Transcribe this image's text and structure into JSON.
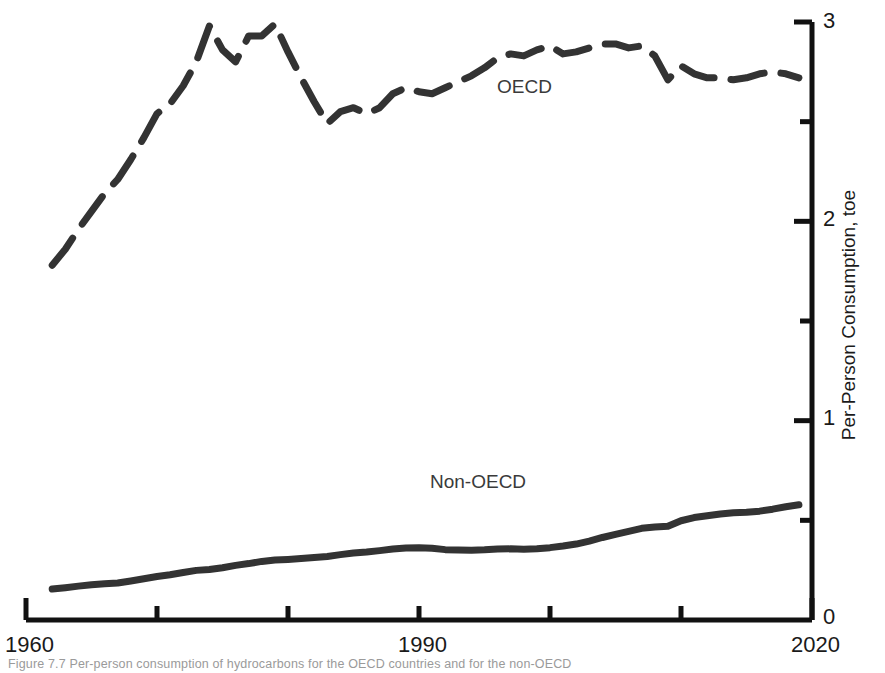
{
  "chart_data": {
    "type": "line",
    "title": "",
    "xlabel": "",
    "ylabel": "Per-Person Consumption, toe",
    "xlim": [
      1960,
      2020
    ],
    "ylim": [
      0,
      3
    ],
    "grid": false,
    "legend_position": "inline-annotation",
    "x_ticks_major": [
      1960,
      1990,
      2020
    ],
    "x_ticks_all": [
      1960,
      1970,
      1980,
      1990,
      2000,
      2010,
      2020
    ],
    "x_tick_labels": [
      "1960",
      "1990",
      "2020"
    ],
    "y_ticks_major": [
      0,
      1,
      2,
      3
    ],
    "y_tick_labels": [
      "0",
      "1",
      "2",
      "3"
    ],
    "y_ticks_minor": [
      0.5,
      1.5,
      2.5
    ],
    "axis_side_y": "right",
    "series": [
      {
        "name": "OECD",
        "style": "dashed",
        "color": "#333333",
        "width": 7,
        "label_x": 1994,
        "label_y": 2.6,
        "x": [
          1962,
          1963,
          1964,
          1965,
          1966,
          1967,
          1968,
          1969,
          1970,
          1971,
          1972,
          1973,
          1974,
          1975,
          1976,
          1977,
          1978,
          1979,
          1980,
          1981,
          1982,
          1983,
          1984,
          1985,
          1986,
          1987,
          1988,
          1989,
          1990,
          1991,
          1992,
          1993,
          1994,
          1995,
          1996,
          1997,
          1998,
          1999,
          2000,
          2001,
          2002,
          2003,
          2004,
          2005,
          2006,
          2007,
          2008,
          2009,
          2010,
          2011,
          2012,
          2013,
          2014,
          2015,
          2016,
          2017,
          2018,
          2019
        ],
        "values": [
          1.78,
          1.86,
          1.96,
          2.05,
          2.14,
          2.21,
          2.31,
          2.42,
          2.54,
          2.59,
          2.68,
          2.8,
          2.98,
          2.86,
          2.8,
          2.93,
          2.93,
          2.99,
          2.85,
          2.72,
          2.6,
          2.49,
          2.55,
          2.57,
          2.54,
          2.57,
          2.64,
          2.67,
          2.65,
          2.64,
          2.67,
          2.7,
          2.73,
          2.77,
          2.82,
          2.84,
          2.83,
          2.86,
          2.88,
          2.84,
          2.85,
          2.87,
          2.89,
          2.89,
          2.87,
          2.88,
          2.83,
          2.71,
          2.78,
          2.74,
          2.72,
          2.72,
          2.71,
          2.72,
          2.74,
          2.75,
          2.74,
          2.72
        ]
      },
      {
        "name": "Non-OECD",
        "style": "solid",
        "color": "#333333",
        "width": 7,
        "label_x": 1992,
        "label_y": 0.75,
        "x": [
          1962,
          1963,
          1964,
          1965,
          1966,
          1967,
          1968,
          1969,
          1970,
          1971,
          1972,
          1973,
          1974,
          1975,
          1976,
          1977,
          1978,
          1979,
          1980,
          1981,
          1982,
          1983,
          1984,
          1985,
          1986,
          1987,
          1988,
          1989,
          1990,
          1991,
          1992,
          1993,
          1994,
          1995,
          1996,
          1997,
          1998,
          1999,
          2000,
          2001,
          2002,
          2003,
          2004,
          2005,
          2006,
          2007,
          2008,
          2009,
          2010,
          2011,
          2012,
          2013,
          2014,
          2015,
          2016,
          2017,
          2018,
          2019
        ],
        "values": [
          0.155,
          0.162,
          0.17,
          0.177,
          0.182,
          0.186,
          0.196,
          0.207,
          0.218,
          0.227,
          0.238,
          0.249,
          0.253,
          0.262,
          0.274,
          0.283,
          0.294,
          0.301,
          0.304,
          0.308,
          0.313,
          0.319,
          0.328,
          0.336,
          0.341,
          0.348,
          0.356,
          0.361,
          0.363,
          0.36,
          0.353,
          0.351,
          0.35,
          0.352,
          0.356,
          0.357,
          0.355,
          0.357,
          0.363,
          0.371,
          0.381,
          0.396,
          0.414,
          0.43,
          0.445,
          0.46,
          0.466,
          0.47,
          0.498,
          0.514,
          0.523,
          0.532,
          0.538,
          0.54,
          0.546,
          0.556,
          0.568,
          0.578
        ]
      }
    ],
    "annotations": [
      {
        "text": "OECD",
        "x": 1994,
        "y": 2.6
      },
      {
        "text": "Non-OECD",
        "x": 1992,
        "y": 0.75
      }
    ]
  },
  "axis": {
    "y_title": "Per-Person Consumption, toe",
    "y_labels": [
      "3",
      "2",
      "1",
      "0"
    ],
    "x_labels": [
      "1960",
      "1990",
      "2020"
    ]
  },
  "caption": {
    "text": "Figure 7.7  Per-person consumption of hydrocarbons for the OECD countries and for the non-OECD"
  }
}
